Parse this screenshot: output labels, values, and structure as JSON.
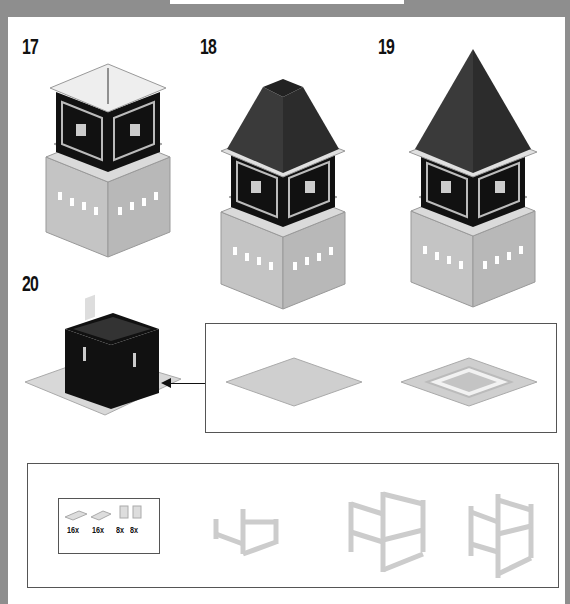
{
  "header": {
    "tab_text": ""
  },
  "steps": [
    {
      "number": "17",
      "description": "Tower clock section with studded top plate"
    },
    {
      "number": "18",
      "description": "Tower with partial dark roof"
    },
    {
      "number": "19",
      "description": "Tower with completed pointed dark roof"
    },
    {
      "number": "20",
      "description": "Black box module on light gray baseplate"
    }
  ],
  "sub_assembly_baseplates": {
    "items": [
      "plain-baseplate",
      "baseplate-with-frame"
    ]
  },
  "parts_callout": {
    "parts": [
      {
        "name": "plate-1x4",
        "qty": "16x"
      },
      {
        "name": "plate-1x3",
        "qty": "16x"
      },
      {
        "name": "brick-1x1-round-a",
        "qty": "8x"
      },
      {
        "name": "brick-1x1-round-b",
        "qty": "8x"
      }
    ]
  },
  "frame_assemblies": [
    "frame-stage-1",
    "frame-stage-2",
    "frame-stage-3"
  ],
  "colors": {
    "background": "#8e8e8e",
    "panel": "#ffffff",
    "black_brick": "#111111",
    "dark_roof": "#333333",
    "light_gray_brick": "#c8c8c8",
    "white_brick": "#e8e8e8"
  }
}
